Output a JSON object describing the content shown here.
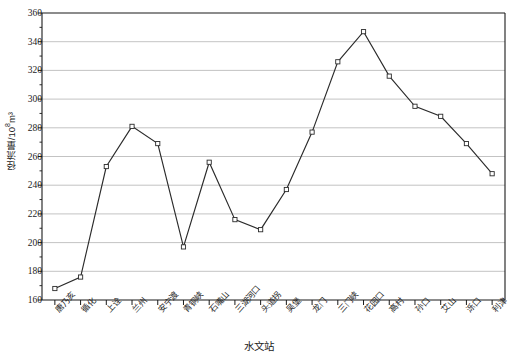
{
  "chart_data": {
    "type": "line",
    "title": "",
    "xlabel": "水文站",
    "ylabel": "径流量/10⁸m³",
    "ylabel_base": "径流量/10",
    "ylabel_exp": "8",
    "ylabel_unit": "m³",
    "ylim": [
      160,
      360
    ],
    "ytick_step": 20,
    "grid": true,
    "legend": "none",
    "marker": "open-square",
    "line_color": "#2b2b2b",
    "grid_color": "#b4b4b4",
    "axis_color": "#1a1a1a",
    "marker_fill": "#ffffff",
    "yticks": [
      160,
      180,
      200,
      220,
      240,
      260,
      280,
      300,
      320,
      340,
      360
    ],
    "categories": [
      "唐乃亥",
      "循化",
      "上诠",
      "兰州",
      "安宁渡",
      "青铜峡",
      "石嘴山",
      "三湖河口",
      "头道拐",
      "吴堡",
      "龙门",
      "三门峡",
      "花园口",
      "高村",
      "孙口",
      "艾山",
      "泺口",
      "利津"
    ],
    "values": [
      168,
      176,
      253,
      281,
      269,
      197,
      256,
      216,
      209,
      237,
      277,
      326,
      347,
      316,
      295,
      288,
      269,
      248
    ],
    "series": [
      {
        "name": "径流量",
        "values": [
          168,
          176,
          253,
          281,
          269,
          197,
          256,
          216,
          209,
          237,
          277,
          326,
          347,
          316,
          295,
          288,
          269,
          248
        ]
      }
    ]
  }
}
